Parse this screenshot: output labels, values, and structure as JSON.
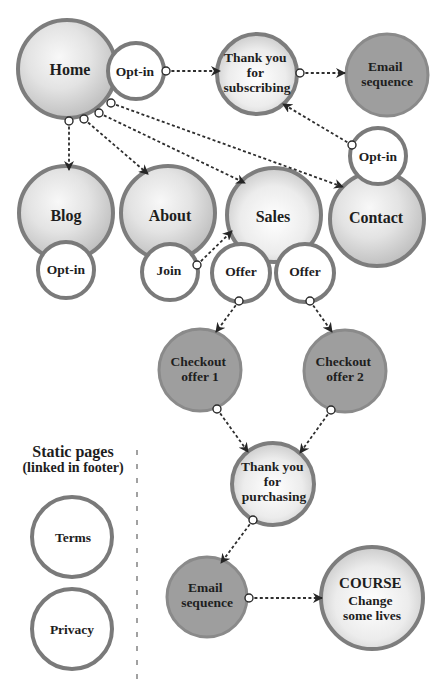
{
  "colors": {
    "border": "#7d7d7d",
    "light_fill": "#dcdcdc",
    "dark_fill": "#9e9e9e",
    "white_fill": "#ffffff",
    "connector": "#2e2e2e",
    "text": "#1e1e1e"
  },
  "nodes": {
    "home": {
      "label": "Home",
      "style": "light"
    },
    "home_optin": {
      "label": "Opt-in",
      "style": "white"
    },
    "thank_you_subscribing": {
      "lines": [
        "Thank you",
        "for",
        "subscribing"
      ],
      "style": "light"
    },
    "email_sequence_top": {
      "lines": [
        "Email",
        "sequence"
      ],
      "style": "dark"
    },
    "contact_optin": {
      "label": "Opt-in",
      "style": "white"
    },
    "blog": {
      "label": "Blog",
      "style": "light"
    },
    "blog_optin": {
      "label": "Opt-in",
      "style": "white"
    },
    "about": {
      "label": "About",
      "style": "light"
    },
    "join": {
      "label": "Join",
      "style": "white"
    },
    "sales": {
      "label": "Sales",
      "style": "light"
    },
    "offer_1": {
      "label": "Offer",
      "style": "white"
    },
    "offer_2": {
      "label": "Offer",
      "style": "white"
    },
    "contact": {
      "label": "Contact",
      "style": "light"
    },
    "checkout_offer_1": {
      "lines": [
        "Checkout",
        "offer 1"
      ],
      "style": "dark"
    },
    "checkout_offer_2": {
      "lines": [
        "Checkout",
        "offer 2"
      ],
      "style": "dark"
    },
    "thank_you_purchasing": {
      "lines": [
        "Thank you",
        "for",
        "purchasing"
      ],
      "style": "light"
    },
    "email_sequence_bottom": {
      "lines": [
        "Email",
        "sequence"
      ],
      "style": "dark"
    },
    "course": {
      "lines": [
        "COURSE",
        "Change",
        "some lives"
      ],
      "style": "light"
    }
  },
  "static_pages": {
    "heading": "Static pages",
    "subheading": "(linked in footer)",
    "items": [
      {
        "label": "Terms"
      },
      {
        "label": "Privacy"
      }
    ]
  },
  "edges": [
    {
      "from": "home_optin",
      "to": "thank_you_subscribing"
    },
    {
      "from": "thank_you_subscribing",
      "to": "email_sequence_top"
    },
    {
      "from": "contact_optin",
      "to": "thank_you_subscribing"
    },
    {
      "from": "home",
      "to": "blog"
    },
    {
      "from": "home",
      "to": "about"
    },
    {
      "from": "home",
      "to": "sales"
    },
    {
      "from": "home",
      "to": "contact"
    },
    {
      "from": "join",
      "to": "sales"
    },
    {
      "from": "offer_1",
      "to": "checkout_offer_1"
    },
    {
      "from": "offer_2",
      "to": "checkout_offer_2"
    },
    {
      "from": "checkout_offer_1",
      "to": "thank_you_purchasing"
    },
    {
      "from": "checkout_offer_2",
      "to": "thank_you_purchasing"
    },
    {
      "from": "thank_you_purchasing",
      "to": "email_sequence_bottom"
    },
    {
      "from": "email_sequence_bottom",
      "to": "course"
    }
  ]
}
